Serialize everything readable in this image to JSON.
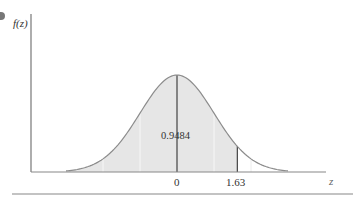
{
  "chart_data": {
    "type": "area",
    "title": "",
    "xlabel": "z",
    "ylabel": "f(z)",
    "tick_labels": [
      "0",
      "1.63"
    ],
    "x_ticks": [
      0,
      1.63
    ],
    "xlim": [
      -3,
      3
    ],
    "distribution": {
      "name": "standard normal",
      "mean": 0,
      "sd": 1
    },
    "shaded_region": {
      "from": "-inf",
      "to": 1.63,
      "area": 0.9484
    },
    "annotation": "0.9484",
    "reference_lines": {
      "dark": [
        0,
        1.63
      ],
      "light": [
        -2,
        -1,
        1,
        2
      ]
    },
    "colors": {
      "shade": "#e6e6e6",
      "curve": "#8c8c8c",
      "axis": "#777777",
      "dark_line": "#333333",
      "light_line": "#f4f4f4"
    },
    "grid": false,
    "legend": null
  },
  "labels": {
    "y_axis": "f(z)",
    "x_axis": "z",
    "tick_zero": "0",
    "tick_163": "1.63",
    "area_value": "0.9484"
  }
}
